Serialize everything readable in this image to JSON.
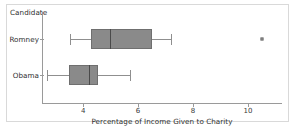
{
  "figure": {
    "legend_title": "Candidate",
    "axis_title": "Percentage of Income Given to Charity"
  },
  "chart_data": {
    "type": "box",
    "orientation": "horizontal",
    "title": "",
    "xlabel": "Percentage of Income Given to Charity",
    "ylabel": "Candidate",
    "xlim": [
      2.5,
      11.2
    ],
    "ticks": [
      4,
      6,
      8,
      10
    ],
    "tick_labels": [
      "4",
      "6",
      "8",
      "10"
    ],
    "grid": false,
    "legend": "none",
    "categories": [
      "Romney",
      "Obama"
    ],
    "boxes": [
      {
        "name": "Romney",
        "whisker_low": 3.52,
        "q1": 4.3,
        "median": 4.98,
        "q3": 6.52,
        "whisker_high": 7.18,
        "outliers": [
          10.52
        ]
      },
      {
        "name": "Obama",
        "whisker_low": 2.7,
        "q1": 3.5,
        "median": 4.22,
        "q3": 4.55,
        "whisker_high": 5.72,
        "outliers": []
      }
    ]
  }
}
